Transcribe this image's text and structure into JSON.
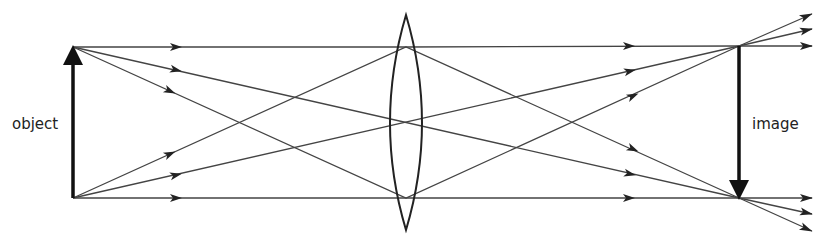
{
  "diagram": {
    "type": "ray diagram - converging lens forming real inverted image",
    "labels": {
      "object": "object",
      "image": "image"
    },
    "colors": {
      "ray": "#444444",
      "arrow": "#111111",
      "lens": "#222222",
      "background": "#ffffff"
    },
    "object": {
      "x": 73,
      "top": 47,
      "bottom": 198
    },
    "lens": {
      "x": 406,
      "top": 15,
      "bottom": 230,
      "half_width": 14
    },
    "image": {
      "x": 739,
      "top": 46,
      "bottom": 198
    }
  }
}
